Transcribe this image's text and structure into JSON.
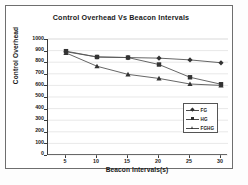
{
  "figure": {
    "title": "Control Overhead Vs Beacon Intervals"
  },
  "axes": {
    "xlabel": "Beacon Intervals(s)",
    "ylabel": "Control Overhead",
    "yticks": [
      "1000",
      "900",
      "800",
      "700",
      "600",
      "500",
      "400",
      "300",
      "200",
      "100",
      "0"
    ],
    "xticks": [
      "5",
      "10",
      "15",
      "20",
      "25",
      "30"
    ]
  },
  "legend": {
    "items": [
      {
        "label": "FG",
        "marker": "diamond",
        "color": "#4a4a4a"
      },
      {
        "label": "HG",
        "marker": "square",
        "color": "#4a4a4a"
      },
      {
        "label": "FGHG",
        "marker": "triangle",
        "color": "#2f2f2f"
      }
    ]
  },
  "chart_data": {
    "type": "line",
    "title": "Control Overhead Vs Beacon Intervals",
    "xlabel": "Beacon Intervals(s)",
    "ylabel": "Control Overhead",
    "x": [
      5,
      10,
      15,
      20,
      25,
      30
    ],
    "xlim": [
      5,
      30
    ],
    "ylim": [
      0,
      1000
    ],
    "ytick_step": 100,
    "grid": true,
    "legend_position": "center-right",
    "series": [
      {
        "name": "FG",
        "marker": "diamond",
        "values": [
          890,
          845,
          840,
          835,
          820,
          795
        ]
      },
      {
        "name": "HG",
        "marker": "square",
        "values": [
          895,
          845,
          840,
          780,
          670,
          610
        ]
      },
      {
        "name": "FGHG",
        "marker": "triangle",
        "values": [
          880,
          765,
          695,
          660,
          612,
          600
        ]
      }
    ]
  }
}
